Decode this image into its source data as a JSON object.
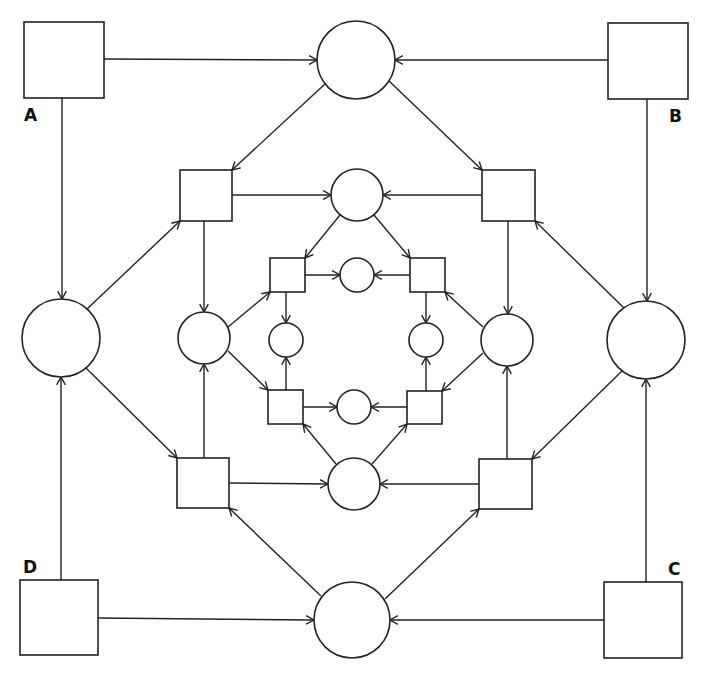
{
  "diagram": {
    "type": "petri-net",
    "stroke_color": "#222222",
    "background": "#ffffff",
    "labels": [
      {
        "id": "A",
        "text": "A",
        "x": 24,
        "y": 107
      },
      {
        "id": "B",
        "text": "B",
        "x": 669,
        "y": 108
      },
      {
        "id": "C",
        "text": "C",
        "x": 668,
        "y": 561
      },
      {
        "id": "D",
        "text": "D",
        "x": 23,
        "y": 559
      }
    ],
    "nodes": [
      {
        "id": "sqA",
        "kind": "transition",
        "label": "A",
        "x": 24,
        "y": 22,
        "w": 80,
        "h": 76
      },
      {
        "id": "sqB",
        "kind": "transition",
        "label": "B",
        "x": 608,
        "y": 23,
        "w": 80,
        "h": 76
      },
      {
        "id": "sqC",
        "kind": "transition",
        "label": "C",
        "x": 604,
        "y": 582,
        "w": 78,
        "h": 76
      },
      {
        "id": "sqD",
        "kind": "transition",
        "label": "D",
        "x": 20,
        "y": 580,
        "w": 78,
        "h": 75
      },
      {
        "id": "cTop",
        "kind": "place",
        "cx": 356,
        "cy": 60,
        "r": 39
      },
      {
        "id": "cLeft",
        "kind": "place",
        "cx": 61,
        "cy": 338,
        "r": 39
      },
      {
        "id": "cRight",
        "kind": "place",
        "cx": 646,
        "cy": 340,
        "r": 39
      },
      {
        "id": "cBottom",
        "kind": "place",
        "cx": 352,
        "cy": 620,
        "r": 38
      },
      {
        "id": "sq2TL",
        "kind": "transition",
        "x": 180,
        "y": 170,
        "w": 52,
        "h": 51
      },
      {
        "id": "sq2TR",
        "kind": "transition",
        "x": 482,
        "y": 170,
        "w": 53,
        "h": 51
      },
      {
        "id": "sq2BL",
        "kind": "transition",
        "x": 177,
        "y": 458,
        "w": 52,
        "h": 50
      },
      {
        "id": "sq2BR",
        "kind": "transition",
        "x": 479,
        "y": 459,
        "w": 53,
        "h": 50
      },
      {
        "id": "c2Top",
        "kind": "place",
        "cx": 357,
        "cy": 195,
        "r": 26
      },
      {
        "id": "c2Left",
        "kind": "place",
        "cx": 204,
        "cy": 338,
        "r": 26
      },
      {
        "id": "c2Right",
        "kind": "place",
        "cx": 507,
        "cy": 340,
        "r": 26
      },
      {
        "id": "c2Bottom",
        "kind": "place",
        "cx": 354,
        "cy": 484,
        "r": 26
      },
      {
        "id": "sq3TL",
        "kind": "transition",
        "x": 270,
        "y": 258,
        "w": 35,
        "h": 34
      },
      {
        "id": "sq3TR",
        "kind": "transition",
        "x": 410,
        "y": 258,
        "w": 35,
        "h": 34
      },
      {
        "id": "sq3BL",
        "kind": "transition",
        "x": 268,
        "y": 390,
        "w": 35,
        "h": 34
      },
      {
        "id": "sq3BR",
        "kind": "transition",
        "x": 407,
        "y": 391,
        "w": 35,
        "h": 33
      },
      {
        "id": "c3Top",
        "kind": "place",
        "cx": 357,
        "cy": 275,
        "r": 17
      },
      {
        "id": "c3Left",
        "kind": "place",
        "cx": 286,
        "cy": 340,
        "r": 17
      },
      {
        "id": "c3Right",
        "kind": "place",
        "cx": 426,
        "cy": 340,
        "r": 17
      },
      {
        "id": "c3Bottom",
        "kind": "place",
        "cx": 354,
        "cy": 407,
        "r": 17
      }
    ],
    "edges": [
      {
        "from": "sqA",
        "to": "cTop",
        "x1": 104,
        "y1": 59,
        "x2": 317,
        "y2": 60
      },
      {
        "from": "sqB",
        "to": "cTop",
        "x1": 608,
        "y1": 60,
        "x2": 395,
        "y2": 60
      },
      {
        "from": "sqA",
        "to": "cLeft",
        "x1": 62,
        "y1": 98,
        "x2": 62,
        "y2": 299
      },
      {
        "from": "sqB",
        "to": "cRight",
        "x1": 647,
        "y1": 99,
        "x2": 647,
        "y2": 301
      },
      {
        "from": "sqD",
        "to": "cLeft",
        "x1": 61,
        "y1": 580,
        "x2": 61,
        "y2": 377
      },
      {
        "from": "sqC",
        "to": "cRight",
        "x1": 646,
        "y1": 582,
        "x2": 646,
        "y2": 379
      },
      {
        "from": "sqD",
        "to": "cBottom",
        "x1": 98,
        "y1": 618,
        "x2": 314,
        "y2": 620
      },
      {
        "from": "sqC",
        "to": "cBottom",
        "x1": 604,
        "y1": 620,
        "x2": 390,
        "y2": 620
      },
      {
        "from": "cTop",
        "to": "sq2TL",
        "x1": 325,
        "y1": 84,
        "x2": 232,
        "y2": 170
      },
      {
        "from": "cTop",
        "to": "sq2TR",
        "x1": 389,
        "y1": 81,
        "x2": 482,
        "y2": 170
      },
      {
        "from": "cLeft",
        "to": "sq2TL",
        "x1": 87,
        "y1": 309,
        "x2": 180,
        "y2": 221
      },
      {
        "from": "cLeft",
        "to": "sq2BL",
        "x1": 86,
        "y1": 368,
        "x2": 177,
        "y2": 458
      },
      {
        "from": "cRight",
        "to": "sq2TR",
        "x1": 624,
        "y1": 308,
        "x2": 535,
        "y2": 221
      },
      {
        "from": "cRight",
        "to": "sq2BR",
        "x1": 622,
        "y1": 371,
        "x2": 532,
        "y2": 459
      },
      {
        "from": "cBottom",
        "to": "sq2BL",
        "x1": 321,
        "y1": 596,
        "x2": 229,
        "y2": 508
      },
      {
        "from": "cBottom",
        "to": "sq2BR",
        "x1": 385,
        "y1": 599,
        "x2": 479,
        "y2": 509
      },
      {
        "from": "sq2TL",
        "to": "c2Top",
        "x1": 232,
        "y1": 195,
        "x2": 331,
        "y2": 195
      },
      {
        "from": "sq2TR",
        "to": "c2Top",
        "x1": 482,
        "y1": 195,
        "x2": 383,
        "y2": 195
      },
      {
        "from": "sq2TL",
        "to": "c2Left",
        "x1": 204,
        "y1": 221,
        "x2": 204,
        "y2": 312
      },
      {
        "from": "sq2BL",
        "to": "c2Left",
        "x1": 204,
        "y1": 458,
        "x2": 204,
        "y2": 364
      },
      {
        "from": "sq2TR",
        "to": "c2Right",
        "x1": 508,
        "y1": 221,
        "x2": 508,
        "y2": 314
      },
      {
        "from": "sq2BR",
        "to": "c2Right",
        "x1": 507,
        "y1": 459,
        "x2": 507,
        "y2": 366
      },
      {
        "from": "sq2BL",
        "to": "c2Bottom",
        "x1": 229,
        "y1": 483,
        "x2": 328,
        "y2": 484
      },
      {
        "from": "sq2BR",
        "to": "c2Bottom",
        "x1": 479,
        "y1": 484,
        "x2": 380,
        "y2": 484
      },
      {
        "from": "c2Top",
        "to": "sq3TL",
        "x1": 340,
        "y1": 215,
        "x2": 305,
        "y2": 258
      },
      {
        "from": "c2Top",
        "to": "sq3TR",
        "x1": 374,
        "y1": 215,
        "x2": 410,
        "y2": 258
      },
      {
        "from": "c2Left",
        "to": "sq3TL",
        "x1": 228,
        "y1": 327,
        "x2": 270,
        "y2": 292
      },
      {
        "from": "c2Left",
        "to": "sq3BL",
        "x1": 228,
        "y1": 351,
        "x2": 268,
        "y2": 390
      },
      {
        "from": "c2Right",
        "to": "sq3TR",
        "x1": 483,
        "y1": 327,
        "x2": 445,
        "y2": 292
      },
      {
        "from": "c2Right",
        "to": "sq3BR",
        "x1": 483,
        "y1": 353,
        "x2": 442,
        "y2": 391
      },
      {
        "from": "c2Bottom",
        "to": "sq3BL",
        "x1": 336,
        "y1": 464,
        "x2": 303,
        "y2": 424
      },
      {
        "from": "c2Bottom",
        "to": "sq3BR",
        "x1": 372,
        "y1": 464,
        "x2": 407,
        "y2": 424
      },
      {
        "from": "sq3TL",
        "to": "c3Top",
        "x1": 305,
        "y1": 275,
        "x2": 340,
        "y2": 275
      },
      {
        "from": "sq3TR",
        "to": "c3Top",
        "x1": 410,
        "y1": 275,
        "x2": 374,
        "y2": 275
      },
      {
        "from": "sq3TL",
        "to": "c3Left",
        "x1": 286,
        "y1": 292,
        "x2": 286,
        "y2": 323
      },
      {
        "from": "sq3BL",
        "to": "c3Left",
        "x1": 286,
        "y1": 390,
        "x2": 286,
        "y2": 357
      },
      {
        "from": "sq3TR",
        "to": "c3Right",
        "x1": 426,
        "y1": 292,
        "x2": 426,
        "y2": 323
      },
      {
        "from": "sq3BR",
        "to": "c3Right",
        "x1": 426,
        "y1": 391,
        "x2": 426,
        "y2": 357
      },
      {
        "from": "sq3BL",
        "to": "c3Bottom",
        "x1": 303,
        "y1": 407,
        "x2": 337,
        "y2": 407
      },
      {
        "from": "sq3BR",
        "to": "c3Bottom",
        "x1": 407,
        "y1": 407,
        "x2": 371,
        "y2": 407
      }
    ]
  }
}
